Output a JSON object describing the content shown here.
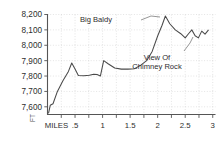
{
  "chart_data": {
    "type": "line",
    "title": "",
    "xlabel": "MILES",
    "ylabel": "FT",
    "xlim": [
      0,
      3.05
    ],
    "ylim": [
      7550,
      8200
    ],
    "grid": true,
    "legend": null,
    "x_ticks": [
      0,
      0.25,
      0.5,
      0.75,
      1,
      1.25,
      1.5,
      1.75,
      2,
      2.25,
      2.5,
      2.75,
      3
    ],
    "x_tick_labels": [
      "MILES",
      "",
      ".5",
      "",
      "1",
      "",
      "1.5",
      "",
      "2",
      "",
      "2.5",
      "",
      "3"
    ],
    "y_ticks": [
      7600,
      7700,
      7800,
      7900,
      8000,
      8100,
      8200
    ],
    "y_tick_labels": [
      "7,600",
      "7,700",
      "7,800",
      "7,900",
      "8,000",
      "8,100",
      "8,200"
    ],
    "series": [
      {
        "name": "Elevation Profile",
        "color": "#4a4a4a",
        "x": [
          0.02,
          0.05,
          0.1,
          0.18,
          0.28,
          0.38,
          0.44,
          0.5,
          0.56,
          0.66,
          0.76,
          0.84,
          0.9,
          0.96,
          1.02,
          1.1,
          1.22,
          1.34,
          1.46,
          1.58,
          1.7,
          1.8,
          1.9,
          2.0,
          2.08,
          2.14,
          2.22,
          2.32,
          2.42,
          2.5,
          2.56,
          2.62,
          2.68,
          2.74,
          2.8,
          2.86,
          2.92
        ],
        "y": [
          7560,
          7610,
          7620,
          7700,
          7770,
          7830,
          7885,
          7845,
          7803,
          7802,
          7805,
          7812,
          7810,
          7800,
          7900,
          7880,
          7852,
          7845,
          7845,
          7848,
          7872,
          7900,
          7960,
          8060,
          8130,
          8190,
          8140,
          8100,
          8075,
          8048,
          8075,
          8100,
          8062,
          8048,
          8092,
          8072,
          8098
        ]
      }
    ],
    "annotations": [
      {
        "id": "big-baldy",
        "text": "Big Baldy",
        "text_x": 96,
        "text_y": 22,
        "leader": "M 141 20 L 151 16 L 160 17"
      },
      {
        "id": "view-of-chimney-rock",
        "line1": "View Of",
        "line2": "Chimney Rock",
        "text_x": 157,
        "text_y": 60,
        "leader": "M 184 51 L 190 43 L 193 37"
      }
    ]
  }
}
